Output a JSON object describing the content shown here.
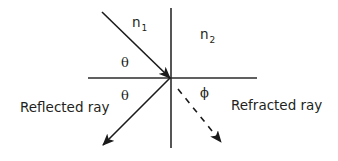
{
  "diagram": {
    "type": "ray-optics-reflection-refraction",
    "colors": {
      "line": "#2b2b2b",
      "text": "#231f20",
      "background": "#ffffff"
    },
    "media": {
      "medium_1": {
        "symbol": "n",
        "subscript": "1"
      },
      "medium_2": {
        "symbol": "n",
        "subscript": "2"
      }
    },
    "angles": {
      "incident": "θ",
      "reflected": "θ",
      "refracted": "ϕ"
    },
    "labels": {
      "reflected_ray": "Reflected ray",
      "refracted_ray": "Refracted ray"
    },
    "rays": [
      {
        "name": "incident",
        "style": "solid",
        "from": [
          102,
          12
        ],
        "to": [
          170,
          78
        ]
      },
      {
        "name": "reflected",
        "style": "solid",
        "from": [
          170,
          78
        ],
        "to": [
          103,
          145
        ]
      },
      {
        "name": "refracted",
        "style": "dashed",
        "from": [
          172,
          81
        ],
        "to": [
          222,
          142
        ]
      }
    ],
    "axes": {
      "interface": {
        "from": [
          88,
          78
        ],
        "to": [
          257,
          78
        ]
      },
      "normal": {
        "from": [
          171,
          8
        ],
        "to": [
          171,
          148
        ]
      }
    }
  }
}
